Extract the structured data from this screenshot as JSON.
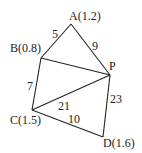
{
  "nodes": {
    "A": {
      "label": "A(1.2)",
      "x": 71,
      "y": 24
    },
    "B": {
      "label": "B(0.8)",
      "x": 41,
      "y": 58
    },
    "P": {
      "label": "P",
      "x": 110,
      "y": 75
    },
    "C": {
      "label": "C(1.5)",
      "x": 32,
      "y": 110
    },
    "D": {
      "label": "D(1.6)",
      "x": 103,
      "y": 137
    }
  },
  "edges": [
    {
      "from": "A",
      "to": "B",
      "label": "5"
    },
    {
      "from": "A",
      "to": "P",
      "label": "9"
    },
    {
      "from": "B",
      "to": "P",
      "label": ""
    },
    {
      "from": "B",
      "to": "C",
      "label": "7"
    },
    {
      "from": "C",
      "to": "P",
      "label": "21"
    },
    {
      "from": "C",
      "to": "D",
      "label": "10"
    },
    {
      "from": "P",
      "to": "D",
      "label": "23"
    }
  ],
  "colors": {
    "line": "#222222",
    "background": "#ffffff"
  }
}
